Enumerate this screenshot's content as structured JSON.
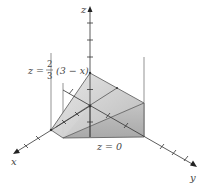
{
  "diagram": {
    "type": "3d-solid-region",
    "axes": {
      "x_label": "x",
      "y_label": "y",
      "z_label": "z"
    },
    "labels": {
      "top_plane": {
        "lhs": "z =",
        "frac_num": "2",
        "frac_den": "3",
        "rhs": "(3 − x)"
      },
      "bottom_plane": "z = 0"
    },
    "colors": {
      "axis": "#333333",
      "face_light": "#d9d9d9",
      "face_mid": "#bdbdbd",
      "face_dark": "#a8a8a8",
      "edge": "#555555",
      "text": "#444444"
    }
  }
}
